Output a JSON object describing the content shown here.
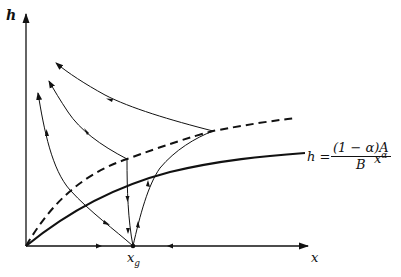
{
  "diagram": {
    "type": "phase-diagram",
    "axes": {
      "y_label": "h",
      "x_label": "x",
      "origin": [
        26,
        246
      ],
      "y_axis_top": [
        26,
        14
      ],
      "x_axis_right": [
        308,
        246
      ]
    },
    "points": {
      "steady_state_x": {
        "label": "x",
        "subscript": "g",
        "pos": [
          133,
          246
        ]
      }
    },
    "curves": {
      "solid_isocline": {
        "style": "solid-thick",
        "label_lhs": "h =",
        "label_num": "(1 − α)A",
        "label_den": "B",
        "label_x": "x",
        "label_exp": "α"
      },
      "dashed_isocline": {
        "style": "dashed-thick"
      }
    },
    "colors": {
      "ink": "#111111",
      "background": "#ffffff"
    }
  }
}
